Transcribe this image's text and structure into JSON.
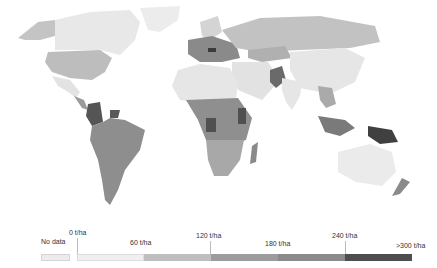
{
  "map": {
    "type": "choropleth",
    "projection": "world",
    "fill_scale": "grayscale",
    "region_fills": {
      "greenland": "#ececec",
      "canada": "#e8e8e8",
      "alaska": "#c4c4c4",
      "usa": "#bdbdbd",
      "mexico": "#e3e3e3",
      "central_america": "#9a9a9a",
      "colombia": "#555555",
      "guianas": "#5a5a5a",
      "south_america": "#8e8e8e",
      "europe": "#8a8a8a",
      "europe_dark": "#3a3a3a",
      "scandinavia": "#d4d4d4",
      "russia": "#c2c2c2",
      "kazakhstan": "#b0b0b0",
      "north_africa": "#e6e6e6",
      "central_africa": "#8f8f8f",
      "congo_kenya": "#505050",
      "southern_africa": "#a8a8a8",
      "madagascar": "#8a8a8a",
      "middle_east": "#e2e2e2",
      "pakistan": "#6a6a6a",
      "india": "#e6e6e6",
      "china": "#e6e6e6",
      "se_asia": "#aaaaaa",
      "indonesia": "#7a7a7a",
      "png": "#404040",
      "australia": "#ebebeb",
      "new_zealand": "#8a8a8a"
    }
  },
  "legend": {
    "no_data_label": "No data",
    "no_data_color": "#ececec",
    "tick_labels": [
      "0 t/ha",
      "60 t/ha",
      "120 t/ha",
      "180 t/ha",
      "240 t/ha",
      ">300 t/ha"
    ],
    "bins": [
      {
        "range": "0–60 t/ha",
        "color": "#efefef"
      },
      {
        "range": "60–120 t/ha",
        "color": "#bfbfbf"
      },
      {
        "range": "120–180 t/ha",
        "color": "#9c9c9c"
      },
      {
        "range": "180–240 t/ha",
        "color": "#8a8a8a"
      },
      {
        "range": "240–>300 t/ha",
        "color": "#4e4e4e"
      }
    ]
  }
}
